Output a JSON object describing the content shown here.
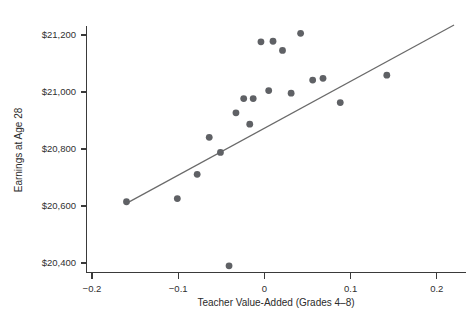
{
  "chart_data": {
    "type": "scatter",
    "title": "",
    "subtitle": "",
    "xlabel": "Teacher Value-Added (Grades 4–8)",
    "ylabel": "Earnings at Age 28",
    "xlim": [
      -0.2,
      0.22
    ],
    "ylim": [
      20330,
      21240
    ],
    "grid": false,
    "legend": null,
    "x_ticks": [
      -0.2,
      -0.1,
      0,
      0.1,
      0.2
    ],
    "x_tick_labels": [
      "−0.2",
      "−0.1",
      "0",
      "0.1",
      "0.2"
    ],
    "y_ticks": [
      20400,
      20600,
      20800,
      21000,
      21200
    ],
    "y_tick_labels": [
      "$20,400",
      "$20,600",
      "$20,800",
      "$21,000",
      "$21,200"
    ],
    "points": [
      {
        "x": -0.16,
        "y": 20615
      },
      {
        "x": -0.101,
        "y": 20626
      },
      {
        "x": -0.078,
        "y": 20711
      },
      {
        "x": -0.064,
        "y": 20841
      },
      {
        "x": -0.051,
        "y": 20788
      },
      {
        "x": -0.041,
        "y": 20390
      },
      {
        "x": -0.033,
        "y": 20927
      },
      {
        "x": -0.024,
        "y": 20977
      },
      {
        "x": -0.017,
        "y": 20887
      },
      {
        "x": -0.013,
        "y": 20977
      },
      {
        "x": -0.004,
        "y": 21176
      },
      {
        "x": 0.005,
        "y": 21005
      },
      {
        "x": 0.01,
        "y": 21178
      },
      {
        "x": 0.021,
        "y": 21146
      },
      {
        "x": 0.031,
        "y": 20996
      },
      {
        "x": 0.042,
        "y": 21206
      },
      {
        "x": 0.056,
        "y": 21042
      },
      {
        "x": 0.068,
        "y": 21048
      },
      {
        "x": 0.088,
        "y": 20963
      },
      {
        "x": 0.142,
        "y": 21059
      }
    ],
    "trend_line": {
      "type": "linear-fit",
      "x_start": -0.159,
      "y_start": 20611,
      "x_end": 0.22,
      "y_end": 21235
    },
    "marker": {
      "shape": "circle",
      "radius_px": 3.4,
      "color": "#5f6165"
    },
    "line_color": "#6a6a6a"
  }
}
